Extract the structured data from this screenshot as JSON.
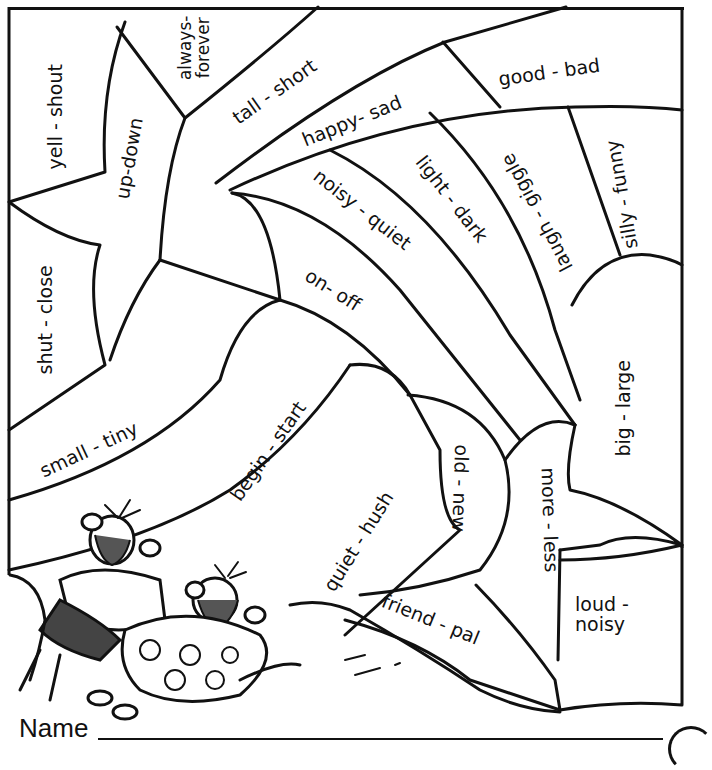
{
  "worksheet": {
    "type": "color-by-synonym puzzle",
    "footer": {
      "name_label": "Name"
    },
    "regions": [
      {
        "id": "yell-shout",
        "label": "yell - shout"
      },
      {
        "id": "up-down",
        "label": "up-down"
      },
      {
        "id": "always-forever",
        "label_line1": "always-",
        "label_line2": "forever"
      },
      {
        "id": "tall-short",
        "label": "tall - short"
      },
      {
        "id": "good-bad",
        "label": "good - bad"
      },
      {
        "id": "happy-sad",
        "label": "happy- sad"
      },
      {
        "id": "laugh-giggle",
        "label": "laugh - giggle"
      },
      {
        "id": "silly-funny",
        "label": "silly - funny"
      },
      {
        "id": "light-dark",
        "label": "light - dark"
      },
      {
        "id": "noisy-quiet",
        "label": "noisy - quiet"
      },
      {
        "id": "shut-close",
        "label": "shut - close"
      },
      {
        "id": "on-off",
        "label": "on- off"
      },
      {
        "id": "small-tiny",
        "label": "small - tiny"
      },
      {
        "id": "big-large",
        "label": "big - large"
      },
      {
        "id": "begin-start",
        "label": "begin - start"
      },
      {
        "id": "quiet-hush",
        "label": "quiet - hush"
      },
      {
        "id": "old-new",
        "label": "old - new"
      },
      {
        "id": "more-less",
        "label": "more - less"
      },
      {
        "id": "friend-pal",
        "label": "friend - pal"
      },
      {
        "id": "loud-noisy",
        "label_line1": "loud -",
        "label_line2": "noisy"
      }
    ],
    "illustration": {
      "subject": "two mice lounging on a hill",
      "icon": "mice-illustration"
    }
  }
}
